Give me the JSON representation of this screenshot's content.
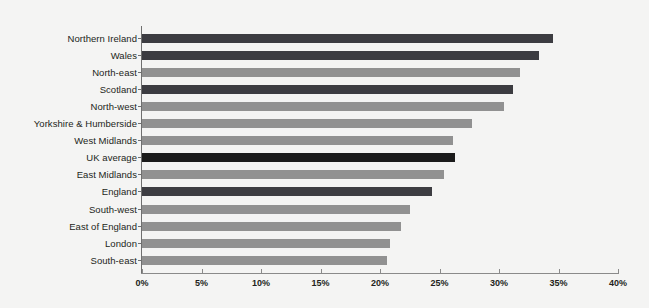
{
  "chart_data": {
    "type": "bar",
    "orientation": "horizontal",
    "title": "",
    "subtitle": "",
    "xlabel": "",
    "ylabel": "",
    "xlim": [
      0,
      40
    ],
    "xticks": [
      "0%",
      "5%",
      "10%",
      "15%",
      "20%",
      "25%",
      "30%",
      "35%",
      "40%"
    ],
    "xtick_values": [
      0,
      5,
      10,
      15,
      20,
      25,
      30,
      35,
      40
    ],
    "grid": false,
    "legend": "none",
    "unit": "%",
    "categories": [
      "Northern Ireland",
      "Wales",
      "North-east",
      "Scotland",
      "North-west",
      "Yorkshire & Humberside",
      "West Midlands",
      "UK average",
      "East Midlands",
      "England",
      "South-west",
      "East of England",
      "London",
      "South-east"
    ],
    "values": [
      34.5,
      33.4,
      31.8,
      31.2,
      30.4,
      27.7,
      26.1,
      26.3,
      25.4,
      24.4,
      22.5,
      21.8,
      20.8,
      20.6
    ],
    "bar_colors": [
      "#3c3c41",
      "#3c3c41",
      "#919191",
      "#3c3c41",
      "#919191",
      "#919191",
      "#919191",
      "#1b1b1b",
      "#919191",
      "#3d3d42",
      "#919191",
      "#919191",
      "#919191",
      "#919191"
    ],
    "colors": {
      "background": "#f4f4f3",
      "dark_bar": "#3c3c41",
      "gray_bar": "#919191",
      "highlight_bar": "#1b1b1b",
      "axis": "#6f6f6f",
      "text": "#231f20"
    }
  }
}
